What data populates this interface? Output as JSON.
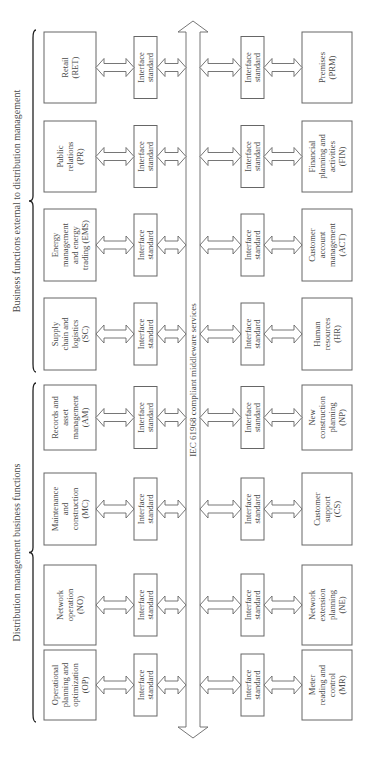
{
  "groups": [
    {
      "label": "Business functions external to distribution management"
    },
    {
      "label": "Distribution management business functions"
    }
  ],
  "bus": {
    "label": "IEC 61968 compliant middleware services"
  },
  "interface_label": [
    "Interface",
    "standard"
  ],
  "top_functions": [
    {
      "lines": [
        "Retail",
        "(RET)"
      ]
    },
    {
      "lines": [
        "Public",
        "relations",
        "(PR)"
      ]
    },
    {
      "lines": [
        "Energy",
        "management",
        "and energy",
        "trading (EMS)"
      ]
    },
    {
      "lines": [
        "Supply",
        "chain and",
        "logistics",
        "(SC)"
      ]
    },
    {
      "lines": [
        "Records and",
        "asset",
        "management",
        "(AM)"
      ]
    },
    {
      "lines": [
        "Maintenance",
        "and",
        "construction",
        "(MC)"
      ]
    },
    {
      "lines": [
        "Network",
        "operation",
        "(NO)"
      ]
    },
    {
      "lines": [
        "Operational",
        "planning and",
        "optimization",
        "(OP)"
      ]
    }
  ],
  "bottom_functions": [
    {
      "lines": [
        "Premises",
        "(PRM)"
      ]
    },
    {
      "lines": [
        "Financial",
        "planning and",
        "activities",
        "(FIN)"
      ]
    },
    {
      "lines": [
        "Customer",
        "account",
        "management",
        "(ACT)"
      ]
    },
    {
      "lines": [
        "Human",
        "resources",
        "(HR)"
      ]
    },
    {
      "lines": [
        "New",
        "construction",
        "planning",
        "(NP)"
      ]
    },
    {
      "lines": [
        "Customer",
        "support",
        "(CS)"
      ]
    },
    {
      "lines": [
        "Network",
        "extension",
        "planning",
        "(NE)"
      ]
    },
    {
      "lines": [
        "Meter",
        "reading and",
        "control",
        "(MR)"
      ]
    }
  ]
}
